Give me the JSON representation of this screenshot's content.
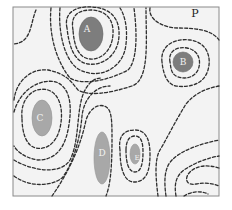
{
  "diagram": {
    "type": "contour-map",
    "corner_label": "P",
    "regions": [
      {
        "id": "A",
        "label": "A",
        "shade": "dark"
      },
      {
        "id": "B",
        "label": "B",
        "shade": "dark"
      },
      {
        "id": "C",
        "label": "C",
        "shade": "light"
      },
      {
        "id": "D",
        "label": "D",
        "shade": "light"
      },
      {
        "id": "E",
        "label": "E",
        "shade": "light"
      }
    ],
    "colors": {
      "dark_region": "#7d7d7d",
      "light_region": "#a8a8a8",
      "contour": "#2e2e2e",
      "background": "#f3f3f3"
    }
  }
}
